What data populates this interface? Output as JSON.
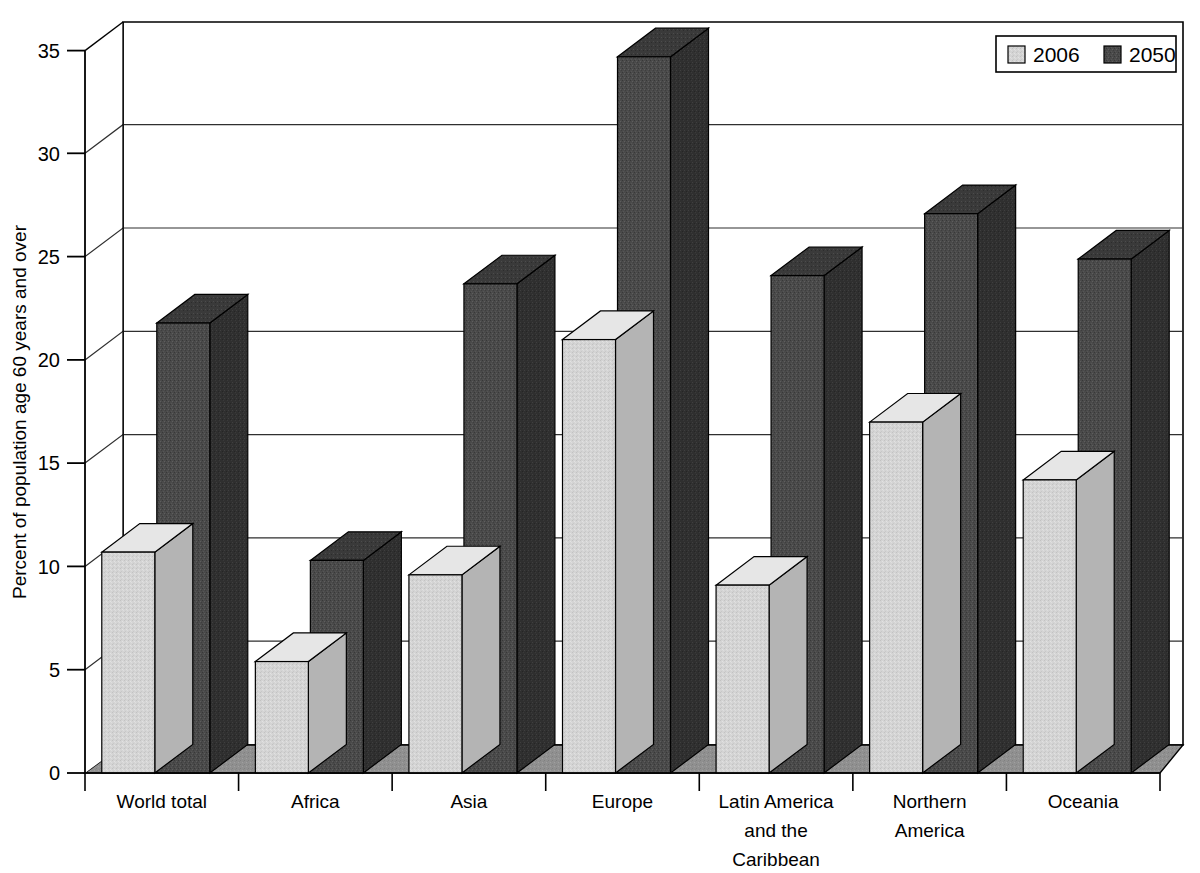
{
  "chart_data": {
    "type": "bar",
    "title": "",
    "subtitle": "",
    "xlabel": "",
    "ylabel": "Percent of population age 60 years and over",
    "categories": [
      "World total",
      "Africa",
      "Asia",
      "Europe",
      "Latin America and the Caribbean",
      "Northern America",
      "Oceania"
    ],
    "category_lines": [
      [
        "World total"
      ],
      [
        "Africa"
      ],
      [
        "Asia"
      ],
      [
        "Europe"
      ],
      [
        "Latin America",
        "and the",
        "Caribbean"
      ],
      [
        "Northern",
        "America"
      ],
      [
        "Oceania"
      ]
    ],
    "series": [
      {
        "name": "2006",
        "color": "#d2d2d2",
        "values": [
          10.7,
          5.4,
          9.6,
          21.0,
          9.1,
          17.0,
          14.2
        ]
      },
      {
        "name": "2050",
        "color": "#4a4a4a",
        "values": [
          21.8,
          10.3,
          23.7,
          34.7,
          24.1,
          27.1,
          24.9
        ]
      }
    ],
    "ylim": [
      0,
      35
    ],
    "yticks": [
      0,
      5,
      10,
      15,
      20,
      25,
      30,
      35
    ],
    "ytick_labels": [
      "0",
      "5",
      "10",
      "15",
      "20",
      "25",
      "30",
      "35"
    ],
    "grid": true,
    "legend_position": "top-right",
    "three_d": true
  },
  "legend": {
    "entries": [
      {
        "label": "2006",
        "swatch": "light-gray"
      },
      {
        "label": "2050",
        "swatch": "dark-gray"
      }
    ]
  },
  "colors": {
    "series_2006": "#d2d2d2",
    "series_2050": "#4a4a4a",
    "series_2006_top": "#e6e6e6",
    "series_2006_side": "#b4b4b4",
    "series_2050_top": "#6b6b6b",
    "series_2050_side": "#2e2e2e",
    "floor": "#8f8f8f",
    "axis": "#000000",
    "grid": "#3a3a3a",
    "background": "#ffffff"
  }
}
